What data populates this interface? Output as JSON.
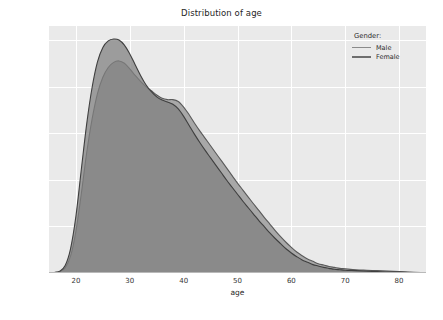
{
  "chart_data": {
    "type": "area",
    "title": "Distribution of age",
    "xlabel": "age",
    "ylabel": "",
    "xlim": [
      15,
      85
    ],
    "ylim": [
      0,
      0.053
    ],
    "grid": true,
    "legend_position": "top-right",
    "legend_title": "Gender:",
    "xticks": [
      20,
      30,
      40,
      50,
      60,
      70,
      80
    ],
    "xtick_labels": [
      "20",
      "30",
      "40",
      "50",
      "60",
      "70",
      "80"
    ],
    "yticks": [
      0.0,
      0.01,
      0.02,
      0.03,
      0.04,
      0.05
    ],
    "ytick_labels": [
      "0.00",
      "0.01",
      "0.02",
      "0.03",
      "0.04",
      "0.05"
    ],
    "series": [
      {
        "name": "Male",
        "color": "#a8a8a8",
        "line_color": "#5a5a5a",
        "x": [
          15,
          16,
          17,
          18,
          19,
          20,
          21,
          22,
          23,
          24,
          25,
          26,
          27,
          28,
          29,
          30,
          31,
          32,
          33,
          34,
          35,
          36,
          37,
          38,
          39,
          40,
          41,
          42,
          43,
          44,
          45,
          46,
          47,
          48,
          49,
          50,
          51,
          52,
          53,
          54,
          55,
          56,
          57,
          58,
          59,
          60,
          61,
          62,
          63,
          64,
          65,
          66,
          67,
          68,
          69,
          70,
          72,
          74,
          76,
          78,
          80,
          82,
          84
        ],
        "values": [
          0.0,
          0.0001,
          0.0003,
          0.0011,
          0.0036,
          0.009,
          0.017,
          0.0258,
          0.033,
          0.0385,
          0.042,
          0.0441,
          0.0452,
          0.0455,
          0.045,
          0.0438,
          0.0424,
          0.0411,
          0.04,
          0.0391,
          0.0382,
          0.0375,
          0.0372,
          0.0372,
          0.0368,
          0.0356,
          0.034,
          0.0322,
          0.0305,
          0.0289,
          0.0273,
          0.0257,
          0.0241,
          0.0225,
          0.0209,
          0.0193,
          0.0178,
          0.0163,
          0.0148,
          0.0134,
          0.0119,
          0.0105,
          0.0091,
          0.0078,
          0.0066,
          0.0055,
          0.0045,
          0.0037,
          0.003,
          0.0025,
          0.002,
          0.0017,
          0.0014,
          0.0012,
          0.001,
          0.0009,
          0.0007,
          0.0006,
          0.0005,
          0.0004,
          0.0003,
          0.0002,
          0.0001
        ]
      },
      {
        "name": "Female",
        "color": "#808080",
        "line_color": "#3f3f3f",
        "x": [
          15,
          16,
          17,
          18,
          19,
          20,
          21,
          22,
          23,
          24,
          25,
          26,
          27,
          28,
          29,
          30,
          31,
          32,
          33,
          34,
          35,
          36,
          37,
          38,
          39,
          40,
          41,
          42,
          43,
          44,
          45,
          46,
          47,
          48,
          49,
          50,
          51,
          52,
          53,
          54,
          55,
          56,
          57,
          58,
          59,
          60,
          61,
          62,
          63,
          64,
          65,
          66,
          67,
          68,
          69,
          70,
          72,
          74,
          76,
          78,
          80,
          82,
          84
        ],
        "values": [
          0.0,
          0.0001,
          0.0004,
          0.0016,
          0.0052,
          0.0122,
          0.0222,
          0.032,
          0.0398,
          0.0453,
          0.0484,
          0.0498,
          0.0502,
          0.05,
          0.0489,
          0.047,
          0.0447,
          0.0424,
          0.0404,
          0.0389,
          0.0378,
          0.0371,
          0.0367,
          0.0362,
          0.0352,
          0.0336,
          0.0317,
          0.0298,
          0.028,
          0.0263,
          0.0247,
          0.0231,
          0.0215,
          0.0199,
          0.0184,
          0.0169,
          0.0154,
          0.014,
          0.0126,
          0.0112,
          0.0099,
          0.0086,
          0.0074,
          0.0063,
          0.0052,
          0.0043,
          0.0035,
          0.0028,
          0.0023,
          0.0018,
          0.0015,
          0.0012,
          0.001,
          0.0008,
          0.0007,
          0.0006,
          0.0005,
          0.0004,
          0.0003,
          0.0002,
          0.0002,
          0.0001,
          0.0001
        ]
      }
    ]
  },
  "legend": {
    "title": "Gender:",
    "items": [
      {
        "label": "Male"
      },
      {
        "label": "Female"
      }
    ]
  },
  "axes": {
    "title": "Distribution of age",
    "x_label": "age"
  },
  "colors": {
    "plot_background": "#eaeaea",
    "gridline": "#ffffff",
    "male_fill": "#a8a8a8",
    "female_fill": "#808080",
    "overlap_fill": "#808080",
    "text": "#262626"
  }
}
